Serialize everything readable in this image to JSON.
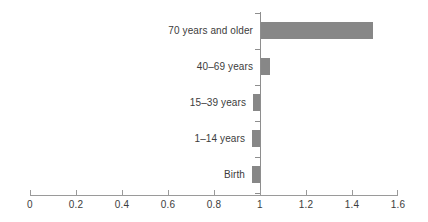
{
  "chart_data": {
    "type": "bar",
    "orientation": "horizontal",
    "title": "",
    "subtitle": "",
    "xlabel": "",
    "ylabel": "",
    "categories": [
      "70 years and older",
      "40–69 years",
      "15–39 years",
      "1–14 years",
      "Birth"
    ],
    "values": [
      1.49,
      1.045,
      0.97,
      0.965,
      0.965
    ],
    "baseline": 1.0,
    "xlim": [
      0,
      1.6
    ],
    "xticks": [
      0,
      0.2,
      0.4,
      0.6,
      0.8,
      1,
      1.2,
      1.4,
      1.6
    ],
    "xtick_labels": [
      "0",
      "0.2",
      "0.4",
      "0.6",
      "0.8",
      "1",
      "1.2",
      "1.4",
      "1.6"
    ],
    "grid": false,
    "legend": null,
    "series": [
      {
        "name": "",
        "color": "#878787",
        "values": [
          1.49,
          1.045,
          0.97,
          0.965,
          0.965
        ]
      }
    ],
    "annotations": []
  },
  "colors": {
    "bar": "#878787",
    "axis": "#8e8e8e",
    "text": "#3c3c3c",
    "background": "#ffffff"
  }
}
